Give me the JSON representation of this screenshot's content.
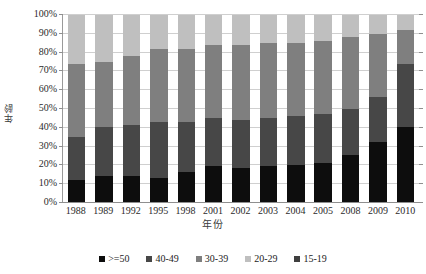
{
  "chart_data": {
    "type": "bar",
    "subtype": "stacked-percent-column",
    "title": "",
    "xlabel": "年份",
    "ylabel": "年龄",
    "categories": [
      "1988",
      "1989",
      "1992",
      "1995",
      "1998",
      "2001",
      "2002",
      "2003",
      "2004",
      "2005",
      "2008",
      "2009",
      "2010"
    ],
    "series": [
      {
        "name": ">=50",
        "color": "#0d0d0d",
        "values": [
          12,
          14,
          14,
          13,
          16,
          19,
          18,
          19,
          20,
          21,
          25,
          32,
          40
        ]
      },
      {
        "name": "40-49",
        "color": "#474747",
        "values": [
          23,
          26,
          27,
          30,
          27,
          26,
          26,
          26,
          26,
          26,
          25,
          24,
          34
        ]
      },
      {
        "name": "30-39",
        "color": "#7f7f7f",
        "values": [
          39,
          35,
          37,
          39,
          39,
          39,
          40,
          40,
          39,
          39,
          38,
          34,
          18
        ]
      },
      {
        "name": "20-29",
        "color": "#bfbfbf",
        "values": [
          26,
          25,
          22,
          18,
          18,
          16,
          16,
          15,
          15,
          14,
          12,
          10,
          8
        ]
      },
      {
        "name": "15-19",
        "color": "#3f3f3f",
        "values": [
          0,
          0,
          0,
          0,
          0,
          0,
          0,
          0,
          0,
          0,
          0,
          0,
          0
        ]
      }
    ],
    "ylim": [
      0,
      100
    ],
    "y_ticks": [
      "0%",
      "10%",
      "20%",
      "30%",
      "40%",
      "50%",
      "60%",
      "70%",
      "80%",
      "90%",
      "100%"
    ],
    "y_tick_values": [
      0,
      10,
      20,
      30,
      40,
      50,
      60,
      70,
      80,
      90,
      100
    ],
    "grid": true,
    "legend_position": "bottom",
    "legend": [
      {
        "label": ">=50",
        "color": "#0d0d0d"
      },
      {
        "label": "40-49",
        "color": "#474747"
      },
      {
        "label": "30-39",
        "color": "#7f7f7f"
      },
      {
        "label": "20-29",
        "color": "#bfbfbf"
      },
      {
        "label": "15-19",
        "color": "#3f3f3f"
      }
    ]
  }
}
